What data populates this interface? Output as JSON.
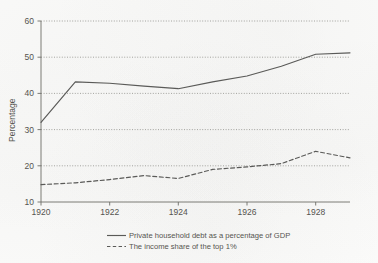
{
  "chart_data": {
    "type": "line",
    "title": "",
    "subtitle": "",
    "xlabel": "",
    "ylabel": "Percentage",
    "xlim": [
      1920,
      1929
    ],
    "ylim": [
      10,
      60
    ],
    "grid": true,
    "grid_axis": "y",
    "grid_style": "dotted",
    "legend_position": "bottom-center",
    "x": [
      1920,
      1921,
      1922,
      1923,
      1924,
      1925,
      1926,
      1927,
      1928,
      1929
    ],
    "xticks": [
      1920,
      1922,
      1924,
      1926,
      1928
    ],
    "xtick_labels": [
      "1920",
      "1922",
      "1924",
      "1926",
      "1928"
    ],
    "yticks": [
      10,
      20,
      30,
      40,
      50,
      60
    ],
    "ytick_labels": [
      "10",
      "20",
      "30",
      "40",
      "50",
      "60"
    ],
    "series": [
      {
        "name": "Private household debt as a percentage of GDP",
        "style": "solid",
        "color": "#5a5a58",
        "values": [
          32.0,
          43.2,
          42.8,
          42.0,
          41.3,
          43.2,
          44.8,
          47.5,
          50.8,
          51.2
        ]
      },
      {
        "name": "The income share of the top 1%",
        "style": "dashed",
        "color": "#5a5a58",
        "values": [
          14.8,
          15.3,
          16.2,
          17.3,
          16.5,
          19.0,
          19.7,
          20.6,
          24.0,
          22.2
        ]
      }
    ]
  },
  "axes": {
    "y_axis_title": "Percentage"
  },
  "legend": {
    "entries": [
      {
        "label": "Private household debt as a percentage of GDP",
        "style": "solid"
      },
      {
        "label": "The income share of the top 1%",
        "style": "dashed"
      }
    ]
  },
  "colors": {
    "line": "#5a5a58",
    "grid": "#9a9a95",
    "axis": "#6d6d68",
    "text": "#55544f",
    "background": "#fbfbfa"
  }
}
